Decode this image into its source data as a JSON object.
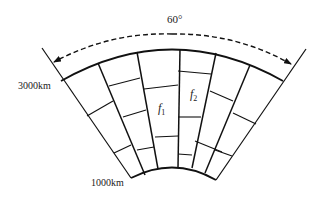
{
  "diagram": {
    "angle_label": "60°",
    "outer_radius_label": "3000km",
    "inner_radius_label": "1000km",
    "cell_labels": [
      {
        "base": "f",
        "sub": "1"
      },
      {
        "base": "f",
        "sub": "2"
      }
    ],
    "colors": {
      "line": "#111111",
      "background": "#ffffff"
    },
    "geometry": {
      "center": [
        173,
        239
      ],
      "outer_radius": 194,
      "inner_radius": 73,
      "boundary_left": {
        "from": [
          42,
          48
        ],
        "to": [
          131,
          178
        ]
      },
      "boundary_right": {
        "from": [
          306,
          49
        ],
        "to": [
          216,
          180
        ]
      },
      "outer_arc": {
        "from": [
          61,
          81
        ],
        "to": [
          283,
          81
        ]
      },
      "inner_arc": {
        "from": [
          131,
          178
        ],
        "to": [
          216,
          180
        ]
      },
      "angle_arrow": {
        "from": [
          52,
          63
        ],
        "to": [
          293,
          65
        ],
        "peak_y": 33
      },
      "dividers": [
        {
          "from": [
            98,
            63
          ],
          "to": [
            145,
            175
          ]
        },
        {
          "from": [
            137,
            52
          ],
          "to": [
            158,
            169
          ]
        },
        {
          "from": [
            180,
            49
          ],
          "to": [
            178,
            167
          ]
        },
        {
          "from": [
            216,
            53
          ],
          "to": [
            192,
            168
          ]
        },
        {
          "from": [
            250,
            65
          ],
          "to": [
            205,
            173
          ]
        }
      ],
      "cross_segments": [
        {
          "from": [
            87,
            116
          ],
          "to": [
            113,
            101
          ]
        },
        {
          "from": [
            114,
            153
          ],
          "to": [
            131,
            145
          ]
        },
        {
          "from": [
            109,
            86
          ],
          "to": [
            140,
            78
          ]
        },
        {
          "from": [
            123,
            117
          ],
          "to": [
            146,
            110
          ]
        },
        {
          "from": [
            137,
            150
          ],
          "to": [
            154,
            147
          ]
        },
        {
          "from": [
            144,
            89
          ],
          "to": [
            178,
            85
          ]
        },
        {
          "from": [
            155,
            137
          ],
          "to": [
            178,
            136
          ]
        },
        {
          "from": [
            178,
            71
          ],
          "to": [
            211,
            74
          ]
        },
        {
          "from": [
            178,
            117
          ],
          "to": [
            201,
            117
          ]
        },
        {
          "from": [
            178,
            154
          ],
          "to": [
            192,
            155
          ]
        },
        {
          "from": [
            210,
            91
          ],
          "to": [
            233,
            101
          ]
        },
        {
          "from": [
            195,
            141
          ],
          "to": [
            222,
            152
          ]
        },
        {
          "from": [
            233,
            113
          ],
          "to": [
            256,
            124
          ]
        },
        {
          "from": [
            215,
            150
          ],
          "to": [
            232,
            156
          ]
        }
      ]
    }
  }
}
